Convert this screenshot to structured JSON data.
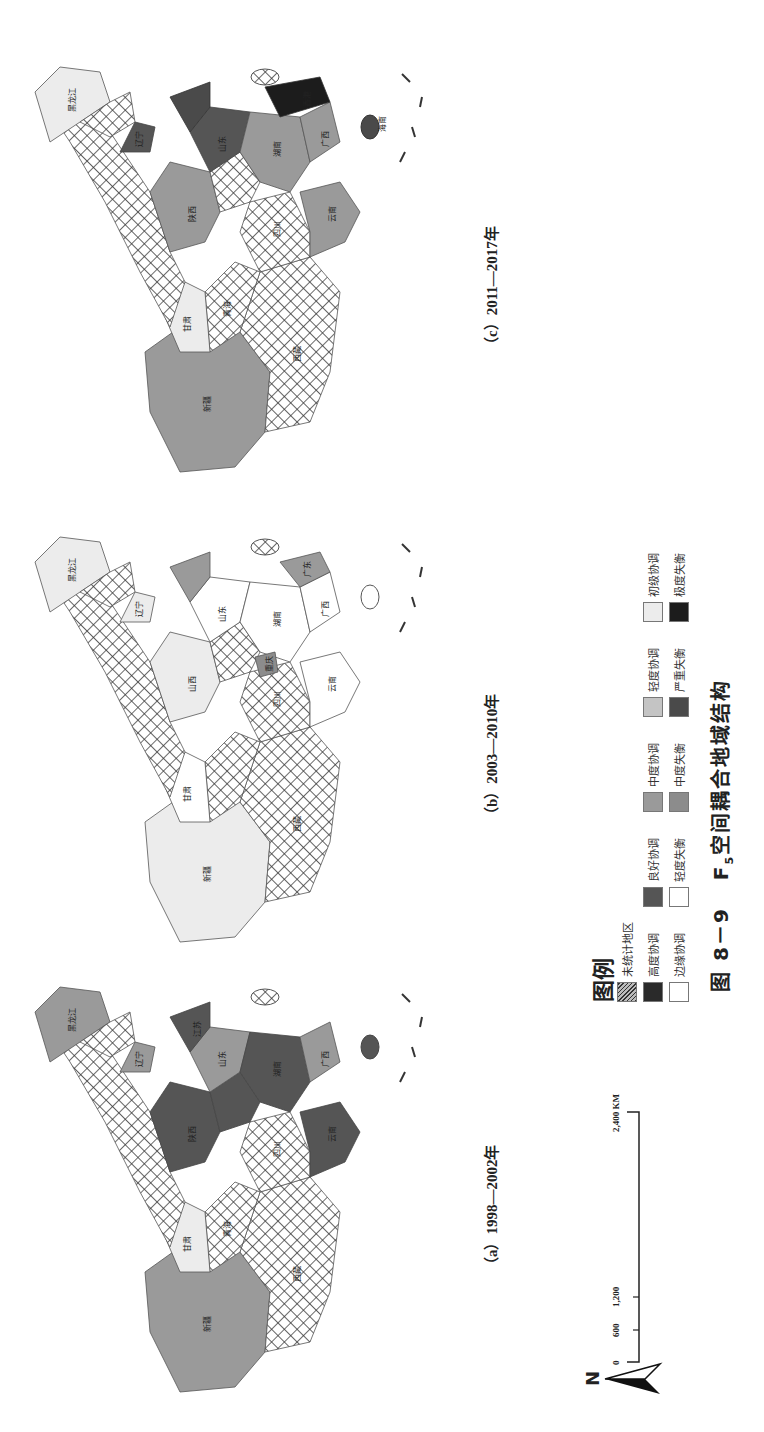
{
  "figure": {
    "number_label": "图 8－9",
    "title_prefix": "F",
    "title_subscript": "5",
    "title_suffix": "空间耦合地域结构"
  },
  "panels": [
    {
      "id": "a",
      "caption": "（a）1998—2002年"
    },
    {
      "id": "b",
      "caption": "（b）2003—2010年"
    },
    {
      "id": "c",
      "caption": "（c）2011—2017年"
    }
  ],
  "legend": {
    "title": "图例",
    "items": [
      {
        "label": "未统计地区",
        "pattern": "hatched",
        "color": "#8a8a8a"
      },
      {
        "label": "高度协调",
        "color": "#2a2a2a"
      },
      {
        "label": "良好协调",
        "color": "#555555"
      },
      {
        "label": "中度协调",
        "color": "#9a9a9a"
      },
      {
        "label": "轻度协调",
        "color": "#c4c4c4"
      },
      {
        "label": "初级协调",
        "color": "#ececec"
      },
      {
        "label": "边缘协调",
        "color": "#ffffff"
      },
      {
        "label": "轻度失衡",
        "color": "#ffffff"
      },
      {
        "label": "中度失衡",
        "color": "#8c8c8c"
      },
      {
        "label": "严重失衡",
        "color": "#4a4a4a"
      },
      {
        "label": "极度失衡",
        "color": "#1c1c1c"
      }
    ]
  },
  "scale_bar": {
    "ticks": [
      "0",
      "600",
      "1,200",
      "2,400 KM"
    ]
  },
  "north_arrow": {
    "label": "N"
  },
  "map_labels": {
    "xinjiang": "新疆",
    "xizang": "西藏",
    "qinghai": "青海",
    "gansu": "甘肃",
    "sichuan": "四川",
    "yunnan": "云南",
    "neimenggu": "内蒙古",
    "heilongjiang": "黑龙江",
    "jilin": "吉林",
    "liaoning": "辽宁",
    "beijing": "北京",
    "tianjin": "天津",
    "hebei": "河北",
    "shanxi": "山西",
    "shandong": "山东",
    "shaanxi": "陕西",
    "henan": "河南",
    "hubei": "湖北",
    "hunan": "湖南",
    "jiangxi": "江西",
    "anhui": "安徽",
    "jiangsu": "江苏",
    "shanghai": "上海",
    "zhejiang": "浙江",
    "fujian": "福建",
    "guangdong": "广东",
    "guangxi": "广西",
    "guizhou": "贵州",
    "chongqing": "重庆",
    "ningxia": "宁夏",
    "hainan": "海南",
    "hongkong": "香港",
    "macau": "澳门"
  }
}
